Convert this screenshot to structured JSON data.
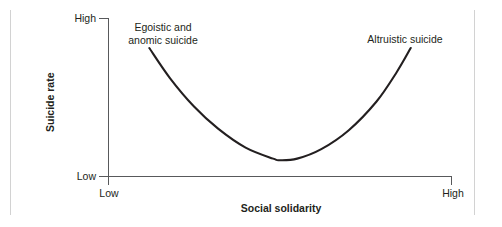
{
  "figure": {
    "background_color": "#ffffff",
    "line_color": "#231f20",
    "axis_color": "#58595b"
  },
  "axes": {
    "y_title": "Suicide rate",
    "x_title": "Social solidarity",
    "y_ticks": [
      "High",
      "Low"
    ],
    "x_ticks": [
      "Low",
      "High"
    ]
  },
  "annotations": {
    "left": "Egoistic and\nanomic suicide",
    "right": "Altruistic suicide"
  },
  "chart_data": {
    "type": "line",
    "title": "",
    "subtitle": "",
    "xlabel": "Social solidarity",
    "ylabel": "Suicide rate",
    "xlim": [
      0,
      1
    ],
    "ylim": [
      0,
      1
    ],
    "xticklabels": [
      "Low",
      "High"
    ],
    "yticklabels": [
      "Low",
      "High"
    ],
    "grid": false,
    "legend": false,
    "series": [
      {
        "name": "Suicide rate vs social solidarity",
        "shape": "u-curve",
        "x": [
          0.12,
          0.18,
          0.25,
          0.32,
          0.4,
          0.48,
          0.5,
          0.55,
          0.62,
          0.7,
          0.78,
          0.84,
          0.88
        ],
        "y": [
          0.81,
          0.62,
          0.44,
          0.3,
          0.18,
          0.11,
          0.1,
          0.11,
          0.17,
          0.29,
          0.47,
          0.66,
          0.81
        ]
      }
    ],
    "annotations": [
      {
        "text": "Egoistic and anomic suicide",
        "x": 0.14,
        "y": 0.93
      },
      {
        "text": "Altruistic suicide",
        "x": 0.87,
        "y": 0.88
      }
    ]
  }
}
